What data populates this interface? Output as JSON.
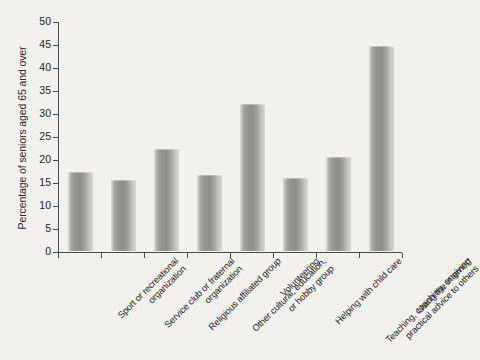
{
  "chart_data": {
    "type": "bar",
    "title": "",
    "xlabel": "",
    "ylabel": "Percentage of seniors aged 65 and over",
    "ylim": [
      0,
      50
    ],
    "ytick_step": 5,
    "yticks": [
      "50",
      "45",
      "40",
      "35",
      "30",
      "25",
      "20",
      "15",
      "10",
      "5",
      "0"
    ],
    "grid": false,
    "legend": "none",
    "categories": [
      "Sport or recreational organization",
      "Service club or fraternal organization",
      "Religious affiliated group",
      "Other cultural, education, or hobby group",
      "Volunteering",
      "Helping with child care",
      "Teaching, coaching, or giving practical advice to others",
      "Using the internet*"
    ],
    "category_lines": [
      [
        "Sport or recreational",
        "organization"
      ],
      [
        "Service club or fraternal",
        "organization"
      ],
      [
        "Religious affiliated group"
      ],
      [
        "Other cultural, education,",
        "or hobby group"
      ],
      [
        "Volunteering"
      ],
      [
        "Helping with child care"
      ],
      [
        "Teaching, coaching, or giving",
        "practical advice to others"
      ],
      [
        "Using the internet*"
      ]
    ],
    "values": [
      17.2,
      15.4,
      22.2,
      16.5,
      32.0,
      15.9,
      20.4,
      44.6
    ],
    "bar_color_light": "#cfcfcb",
    "bar_color_dark": "#8e8e8a",
    "axis_color": "#4a4a4a",
    "background_color": "#f2f1ee"
  }
}
